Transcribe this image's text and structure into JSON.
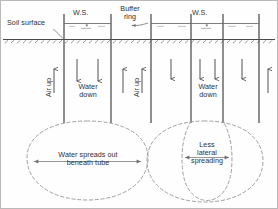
{
  "figure": {
    "type": "diagram",
    "panels": [
      {
        "id": "left",
        "description": "Single tube infiltrometer - water spreads laterally below the tube",
        "flow_labels": {
          "air": "Air up",
          "water": "Water\ndown"
        },
        "bulb_label": "Water spreads out\nbeneath tube"
      },
      {
        "id": "right",
        "description": "Tube with buffer ring - lateral spreading is reduced",
        "flow_labels": {
          "air": "Air up",
          "water": "Water\ndown"
        },
        "bulb_label": "Less\nlateral\nspreading"
      }
    ]
  },
  "labels": {
    "soil_surface": "Soil surface",
    "buffer_ring": "Buffer\nring",
    "water_surface_left": "W.S.",
    "water_surface_right": "W.S.",
    "air_up_left": "Air up",
    "air_up_right": "Air up",
    "water_down_left": "Water\ndown",
    "water_down_right": "Water\ndown",
    "bulb_left": "Water spreads out\nbeneath tube",
    "bulb_right": "Less\nlateral\nspreading"
  },
  "colors": {
    "line": "#4a4a4a",
    "dashed": "#8a8a8a",
    "text": "#2f2f2f",
    "frame": "#b9b9b9",
    "water_surface": "#6e6e6e"
  }
}
